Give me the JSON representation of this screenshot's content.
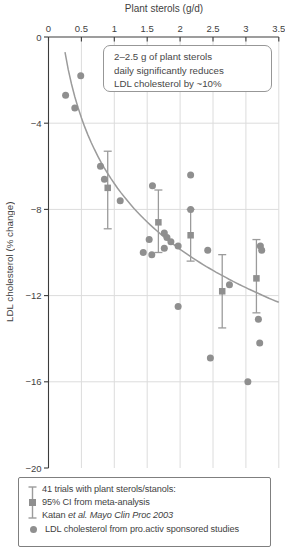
{
  "title": "Plant sterols (g/d)",
  "ylabel": "LDL cholesterol (% change)",
  "annotation": {
    "line1": "2–2.5 g of plant sterols",
    "line2": "daily significantly reduces",
    "line3": "LDL cholesterol by ~10%"
  },
  "legend": {
    "meta_line1": "41 trials with plant sterols/stanols:",
    "meta_line2": "95% CI from meta-analysis",
    "meta_line3_normal": "Katan ",
    "meta_line3_italic": "et al. Mayo Clin Proc 2003",
    "circle_line": "LDL cholesterol from pro.activ sponsored studies"
  },
  "colors": {
    "marker": "#8f8f8f",
    "curve": "#9b9b9b",
    "errorbar": "#9b9b9b",
    "grid": "#dcdcdc",
    "axis": "#3c3c3c",
    "text": "#3f3f3f"
  },
  "chart_data": {
    "type": "scatter",
    "title": "Plant sterols (g/d)",
    "xlabel": "Plant sterols (g/d)",
    "ylabel": "LDL cholesterol (% change)",
    "xlim": [
      0,
      3.5
    ],
    "ylim": [
      -20,
      0
    ],
    "x_ticks": [
      0,
      0.5,
      1,
      1.5,
      2,
      2.5,
      3,
      3.5
    ],
    "x_tick_labels": [
      "0",
      "0.5",
      "1",
      "1.5",
      "2",
      "2.5",
      "3",
      "3.5"
    ],
    "y_ticks": [
      0,
      -4,
      -8,
      -12,
      -16,
      -20
    ],
    "y_tick_labels": [
      "0",
      "−4",
      "−8",
      "−12",
      "−16",
      "−20"
    ],
    "grid_x": [
      0.5,
      1,
      1.5,
      2,
      2.5,
      3,
      3.5
    ],
    "grid_y": [
      -4,
      -8,
      -12,
      -16
    ],
    "series": [
      {
        "name": "LDL cholesterol from pro.activ sponsored studies",
        "marker": "circle",
        "points": [
          [
            0.26,
            -2.7
          ],
          [
            0.4,
            -3.3
          ],
          [
            0.49,
            -1.8
          ],
          [
            0.79,
            -6.0
          ],
          [
            0.85,
            -6.6
          ],
          [
            1.09,
            -7.6
          ],
          [
            1.44,
            -10.0
          ],
          [
            1.53,
            -9.4
          ],
          [
            1.57,
            -10.1
          ],
          [
            1.58,
            -6.9
          ],
          [
            1.76,
            -9.1
          ],
          [
            1.76,
            -9.8
          ],
          [
            1.8,
            -9.3
          ],
          [
            1.86,
            -9.5
          ],
          [
            1.97,
            -9.7
          ],
          [
            1.97,
            -12.5
          ],
          [
            2.16,
            -6.4
          ],
          [
            2.16,
            -8.0
          ],
          [
            2.42,
            -9.9
          ],
          [
            2.46,
            -14.9
          ],
          [
            2.75,
            -11.5
          ],
          [
            3.03,
            -16.0
          ],
          [
            3.19,
            -13.1
          ],
          [
            3.21,
            -14.2
          ],
          [
            3.22,
            -9.7
          ],
          [
            3.24,
            -9.9
          ]
        ]
      },
      {
        "name": "95% CI from meta-analysis (Katan et al. Mayo Clin Proc 2003)",
        "marker": "square-errorbar",
        "points": [
          {
            "x": 0.9,
            "y": -7.0,
            "ci": [
              -8.9,
              -5.3
            ]
          },
          {
            "x": 1.67,
            "y": -8.6,
            "ci": [
              -10.0,
              -7.1
            ]
          },
          {
            "x": 2.16,
            "y": -9.2,
            "ci": [
              -10.4,
              -8.0
            ]
          },
          {
            "x": 2.64,
            "y": -11.8,
            "ci": [
              -13.5,
              -10.1
            ]
          },
          {
            "x": 3.16,
            "y": -11.2,
            "ci": [
              -12.8,
              -9.4
            ]
          }
        ]
      }
    ],
    "trend_curve": {
      "formula": "y = a + b*ln(x)",
      "a": -6.8,
      "b": -4.4,
      "x_start": 0.25,
      "x_end": 3.5
    }
  }
}
